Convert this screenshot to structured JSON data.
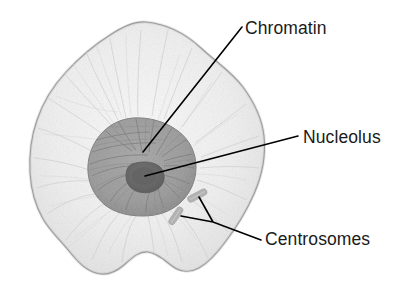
{
  "figure": {
    "background_color": "#ffffff",
    "width": 418,
    "height": 300
  },
  "colors": {
    "cytoplasm_fill": "#f1f1f1",
    "cytoplasm_outline": "#8d8d8d",
    "cytoplasm_texture": "#d8d8d8",
    "nucleus_fill": "#9a9a9a",
    "nucleus_outline": "#7a7a7a",
    "nucleus_texture": "#7d7d7d",
    "nucleolus_fill": "#6a6a6a",
    "centrosome_fill": "#b4b4b4",
    "leader_line": "#000000",
    "label_text": "#1a1a1a"
  },
  "labels": [
    {
      "id": "chromatin",
      "text": "Chromatin",
      "x": 245,
      "y": 34,
      "anchor": "start"
    },
    {
      "id": "nucleolus",
      "text": "Nucleolus",
      "x": 303,
      "y": 143,
      "anchor": "start"
    },
    {
      "id": "centrosomes",
      "text": "Centrosomes",
      "x": 265,
      "y": 245,
      "anchor": "start"
    }
  ],
  "leader_lines": [
    {
      "id": "chromatin-leader",
      "for": "chromatin",
      "path": "M 242 27 L 143 152"
    },
    {
      "id": "nucleolus-leader",
      "for": "nucleolus",
      "path": "M 298 136 L 145 176"
    },
    {
      "id": "centrosomes-leader",
      "for": "centrosomes",
      "path": "M 261 240 L 213 222 L 181 216 M 213 222 L 199 197"
    }
  ],
  "structures": [
    {
      "id": "cell-body",
      "name": "cell body",
      "center_x": 147,
      "center_y": 150
    },
    {
      "id": "nucleus",
      "name": "nucleus",
      "center_x": 140,
      "center_y": 163
    },
    {
      "id": "nucleolus-body",
      "name": "nucleolus",
      "center_x": 145,
      "center_y": 176
    },
    {
      "id": "centrosome-upper",
      "name": "centrosome",
      "center_x": 196,
      "center_y": 196
    },
    {
      "id": "centrosome-lower",
      "name": "centrosome",
      "center_x": 176,
      "center_y": 216
    }
  ]
}
